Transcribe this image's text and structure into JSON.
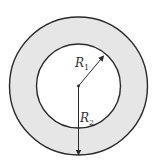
{
  "diagram": {
    "colors": {
      "annulus_fill": "#e6e6e6",
      "inner_fill": "#ffffff",
      "stroke": "#2a2a2a"
    },
    "labels": {
      "r1": {
        "main": "R",
        "sub": "1"
      },
      "r2": {
        "main": "R",
        "sub": "2"
      }
    }
  }
}
